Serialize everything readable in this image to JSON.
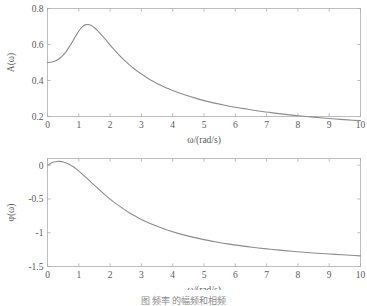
{
  "figure": {
    "caption": "图        频率  的幅频和相频"
  },
  "panels": [
    {
      "name": "amplitude",
      "xlabel": "ω/(rad/s)",
      "ylabel": "A(ω)",
      "xticks": [
        "0",
        "1",
        "2",
        "3",
        "4",
        "5",
        "6",
        "7",
        "8",
        "9",
        "10"
      ],
      "yticks": [
        "0.2",
        "0.4",
        "0.6",
        "0.8"
      ]
    },
    {
      "name": "phase",
      "xlabel": "ω/(rad/s)",
      "ylabel": "φ(ω)",
      "xticks": [
        "0",
        "1",
        "2",
        "3",
        "4",
        "5",
        "6",
        "7",
        "8",
        "9",
        "10"
      ],
      "yticks": [
        "-1.5",
        "-1",
        "-0.5",
        "0"
      ]
    }
  ],
  "chart_data": [
    {
      "type": "line",
      "title": "",
      "subtitle": "",
      "xlabel": "ω/(rad/s)",
      "ylabel": "A(ω)",
      "xlim": [
        0,
        10
      ],
      "ylim": [
        0.2,
        0.8
      ],
      "xticks": [
        0,
        1,
        2,
        3,
        4,
        5,
        6,
        7,
        8,
        9,
        10
      ],
      "yticks": [
        0.2,
        0.4,
        0.6,
        0.8
      ],
      "grid": false,
      "legend": "none",
      "line_color": "#8d8d8d",
      "series": [
        {
          "name": "A(ω)",
          "x": [
            0.0,
            0.1,
            0.2,
            0.3,
            0.4,
            0.5,
            0.6,
            0.7,
            0.8,
            0.9,
            1.0,
            1.1,
            1.2,
            1.3,
            1.4,
            1.5,
            1.6,
            1.7,
            1.8,
            1.9,
            2.0,
            2.2,
            2.4,
            2.6,
            2.8,
            3.0,
            3.2,
            3.4,
            3.6,
            3.8,
            4.0,
            4.4,
            4.8,
            5.2,
            5.6,
            6.0,
            6.4,
            6.8,
            7.2,
            7.6,
            8.0,
            8.4,
            8.8,
            9.2,
            9.6,
            10.0
          ],
          "y": [
            0.5,
            0.501,
            0.505,
            0.513,
            0.525,
            0.541,
            0.562,
            0.588,
            0.617,
            0.647,
            0.675,
            0.697,
            0.709,
            0.711,
            0.705,
            0.693,
            0.677,
            0.658,
            0.638,
            0.618,
            0.597,
            0.558,
            0.522,
            0.49,
            0.461,
            0.436,
            0.413,
            0.393,
            0.375,
            0.359,
            0.344,
            0.319,
            0.298,
            0.28,
            0.265,
            0.251,
            0.24,
            0.229,
            0.22,
            0.212,
            0.204,
            0.198,
            0.192,
            0.186,
            0.181,
            0.177
          ]
        }
      ]
    },
    {
      "type": "line",
      "title": "",
      "subtitle": "",
      "xlabel": "ω/(rad/s)",
      "ylabel": "φ(ω)",
      "xlim": [
        0,
        10
      ],
      "ylim": [
        -1.5,
        0.1
      ],
      "xticks": [
        0,
        1,
        2,
        3,
        4,
        5,
        6,
        7,
        8,
        9,
        10
      ],
      "yticks": [
        -1.5,
        -1,
        -0.5,
        0
      ],
      "grid": false,
      "legend": "none",
      "line_color": "#8d8d8d",
      "series": [
        {
          "name": "φ(ω)",
          "x": [
            0.0,
            0.1,
            0.2,
            0.3,
            0.4,
            0.5,
            0.6,
            0.7,
            0.8,
            0.9,
            1.0,
            1.2,
            1.4,
            1.6,
            1.8,
            2.0,
            2.2,
            2.4,
            2.6,
            2.8,
            3.0,
            3.4,
            3.8,
            4.2,
            4.6,
            5.0,
            5.4,
            5.8,
            6.2,
            6.6,
            7.0,
            7.4,
            7.8,
            8.2,
            8.6,
            9.0,
            9.4,
            9.8,
            10.0
          ],
          "y": [
            0.0,
            0.027,
            0.047,
            0.056,
            0.057,
            0.049,
            0.034,
            0.012,
            -0.016,
            -0.049,
            -0.086,
            -0.168,
            -0.254,
            -0.34,
            -0.423,
            -0.501,
            -0.573,
            -0.639,
            -0.699,
            -0.753,
            -0.802,
            -0.886,
            -0.955,
            -1.013,
            -1.061,
            -1.102,
            -1.137,
            -1.168,
            -1.194,
            -1.218,
            -1.239,
            -1.257,
            -1.274,
            -1.289,
            -1.303,
            -1.315,
            -1.326,
            -1.337,
            -1.342
          ]
        }
      ]
    }
  ]
}
